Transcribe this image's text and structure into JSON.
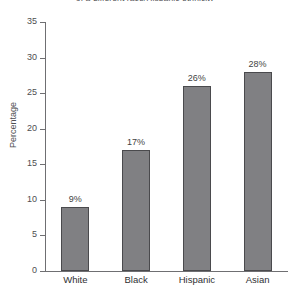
{
  "chart_data": {
    "type": "bar",
    "title": "of a different race/Hispanic ethnicity",
    "xlabel": "",
    "ylabel": "Percentage",
    "categories": [
      "White",
      "Black",
      "Hispanic",
      "Asian"
    ],
    "values": [
      9,
      17,
      26,
      28
    ],
    "value_labels": [
      "9%",
      "17%",
      "26%",
      "28%"
    ],
    "ylim": [
      0,
      35
    ],
    "yticks": [
      0,
      5,
      10,
      15,
      20,
      25,
      30,
      35
    ],
    "ytick_labels": [
      "0",
      "5",
      "10",
      "15",
      "20",
      "25",
      "30",
      "35"
    ],
    "grid": false,
    "legend": null,
    "bar_color": "#808083",
    "bar_edge_color": "#4a4a4d",
    "axis_color": "#6f6f72",
    "text_color": "#2f2f32"
  }
}
